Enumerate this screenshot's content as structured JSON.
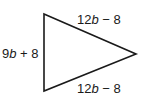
{
  "diagram": {
    "type": "triangle",
    "stroke_color": "#1a1a1a",
    "vertices": {
      "top_left": [
        44,
        14
      ],
      "bottom_left": [
        44,
        91
      ],
      "right": [
        136,
        54
      ]
    },
    "sides": {
      "left": {
        "coef": "9",
        "var": "b",
        "op": " + ",
        "const": "8"
      },
      "top": {
        "coef": "12",
        "var": "b",
        "op": " − ",
        "const": "8"
      },
      "bottom": {
        "coef": "12",
        "var": "b",
        "op": " − ",
        "const": "8"
      }
    }
  }
}
